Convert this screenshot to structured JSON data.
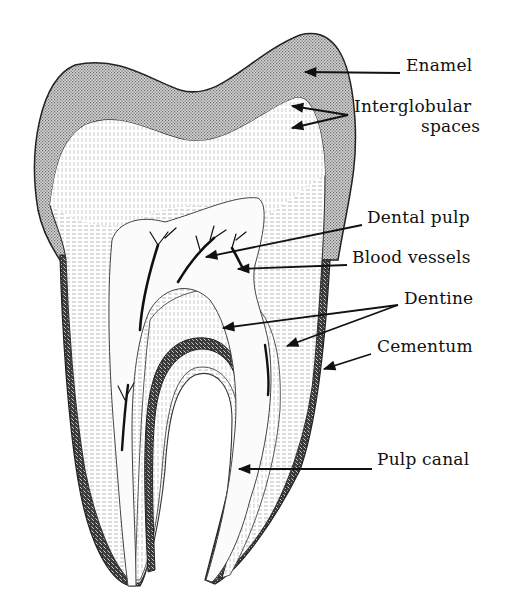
{
  "diagram": {
    "colors": {
      "ink": "#111111",
      "enamel": "#c9c9c9",
      "cementum": "#555555",
      "dentine": "#f2f2f2",
      "pulp": "#fbfbfb",
      "background": "#ffffff"
    },
    "labels": [
      {
        "id": "enamel",
        "text": "Enamel",
        "x": 406,
        "y": 65
      },
      {
        "id": "interglobular-1",
        "text": "Interglobular",
        "x": 354,
        "y": 106
      },
      {
        "id": "interglobular-2",
        "text": "spaces",
        "x": 421,
        "y": 126
      },
      {
        "id": "dental-pulp",
        "text": "Dental pulp",
        "x": 367,
        "y": 217
      },
      {
        "id": "blood-vessels",
        "text": "Blood vessels",
        "x": 352,
        "y": 257
      },
      {
        "id": "dentine",
        "text": "Dentine",
        "x": 404,
        "y": 298
      },
      {
        "id": "cementum",
        "text": "Cementum",
        "x": 377,
        "y": 346
      },
      {
        "id": "pulp-canal",
        "text": "Pulp canal",
        "x": 377,
        "y": 459
      }
    ],
    "arrows": [
      {
        "for": "enamel",
        "from": [
          400,
          73
        ],
        "to": [
          305,
          72
        ]
      },
      {
        "for": "interglobular",
        "from": [
          348,
          115
        ],
        "to": [
          292,
          106
        ]
      },
      {
        "for": "interglobular",
        "from": [
          348,
          115
        ],
        "to": [
          292,
          128
        ]
      },
      {
        "for": "dental-pulp",
        "from": [
          362,
          225
        ],
        "to": [
          206,
          257
        ]
      },
      {
        "for": "blood-vessels",
        "from": [
          347,
          265
        ],
        "to": [
          238,
          269
        ]
      },
      {
        "for": "dentine",
        "from": [
          398,
          305
        ],
        "to": [
          223,
          328
        ]
      },
      {
        "for": "dentine",
        "from": [
          398,
          305
        ],
        "to": [
          287,
          346
        ]
      },
      {
        "for": "cementum",
        "from": [
          371,
          354
        ],
        "to": [
          324,
          369
        ]
      },
      {
        "for": "pulp-canal",
        "from": [
          372,
          469
        ],
        "to": [
          239,
          469
        ]
      }
    ]
  }
}
